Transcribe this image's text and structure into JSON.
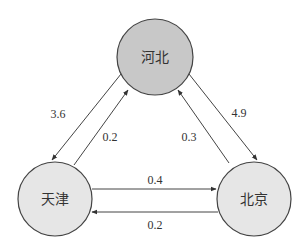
{
  "diagram": {
    "type": "directed-graph",
    "nodes": [
      {
        "id": "hebei",
        "label": "河北",
        "fill": "#c8c8c8"
      },
      {
        "id": "tianjin",
        "label": "天津",
        "fill": "#e6e6e6"
      },
      {
        "id": "beijing",
        "label": "北京",
        "fill": "#e6e6e6"
      }
    ],
    "edges": [
      {
        "from": "hebei",
        "to": "tianjin",
        "label": "3.6"
      },
      {
        "from": "tianjin",
        "to": "hebei",
        "label": "0.2"
      },
      {
        "from": "hebei",
        "to": "beijing",
        "label": "4.9"
      },
      {
        "from": "beijing",
        "to": "hebei",
        "label": "0.3"
      },
      {
        "from": "tianjin",
        "to": "beijing",
        "label": "0.4"
      },
      {
        "from": "beijing",
        "to": "tianjin",
        "label": "0.2"
      }
    ]
  }
}
